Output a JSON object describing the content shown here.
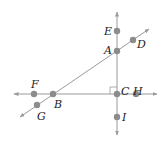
{
  "diagram": {
    "type": "geometry-lines",
    "colors": {
      "line": "#9a9a9a",
      "point": "#8c8c8c",
      "text": "#222222",
      "right_angle": "#9a9a9a"
    },
    "lines": [
      {
        "id": "vertical",
        "through": [
          "E",
          "A",
          "C",
          "I"
        ],
        "from": [
          117,
          12
        ],
        "to": [
          117,
          135
        ],
        "arrows": "both"
      },
      {
        "id": "horizontal",
        "through": [
          "F",
          "B",
          "C",
          "H"
        ],
        "from": [
          14,
          94
        ],
        "to": [
          157,
          94
        ],
        "arrows": "both"
      },
      {
        "id": "diagonal",
        "through": [
          "G",
          "B",
          "A",
          "D"
        ],
        "from": [
          20,
          117
        ],
        "to": [
          149,
          29
        ],
        "arrows": "both"
      }
    ],
    "right_angle_at": "C",
    "points": [
      {
        "name": "A",
        "x": 117,
        "y": 51,
        "label_x": 104,
        "label_y": 54
      },
      {
        "name": "B",
        "x": 53,
        "y": 94,
        "label_x": 54,
        "label_y": 108
      },
      {
        "name": "C",
        "x": 117,
        "y": 94,
        "label_x": 121,
        "label_y": 95
      },
      {
        "name": "D",
        "x": 133,
        "y": 40,
        "label_x": 137,
        "label_y": 48
      },
      {
        "name": "E",
        "x": 117,
        "y": 31,
        "label_x": 104,
        "label_y": 35
      },
      {
        "name": "F",
        "x": 34,
        "y": 94,
        "label_x": 31,
        "label_y": 88
      },
      {
        "name": "G",
        "x": 37,
        "y": 105,
        "label_x": 37,
        "label_y": 120
      },
      {
        "name": "H",
        "x": 136,
        "y": 94,
        "label_x": 133,
        "label_y": 95
      },
      {
        "name": "I",
        "x": 117,
        "y": 117,
        "label_x": 122,
        "label_y": 121
      }
    ]
  }
}
